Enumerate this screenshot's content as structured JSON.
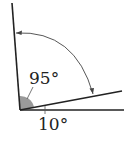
{
  "diagram": {
    "type": "angle-diagram",
    "labels": {
      "angle_large": "95°",
      "angle_small": "10°"
    },
    "colors": {
      "lines": "#222222",
      "shaded_angle": "#9a9a9a",
      "arc": "#444444"
    }
  }
}
